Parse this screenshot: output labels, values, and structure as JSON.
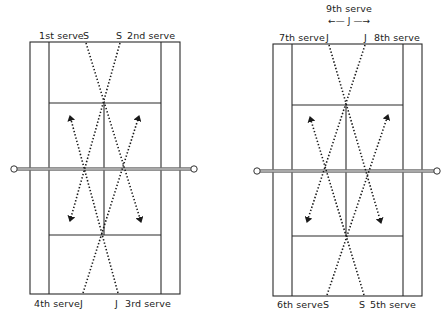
{
  "diagram": {
    "left_court": {
      "labels": {
        "top_left": "1st serve",
        "top_left_marker": "S",
        "top_right_marker": "S",
        "top_right": "2nd serve",
        "bottom_left": "4th serve",
        "bottom_left_marker": "J",
        "bottom_right_marker": "J",
        "bottom_right": "3rd serve"
      }
    },
    "right_court": {
      "labels": {
        "center_top": "9th serve",
        "center_arrow_marker": "←— J —→",
        "top_left": "7th serve",
        "top_left_marker": "J",
        "top_right_marker": "J",
        "top_right": "8th serve",
        "bottom_left": "6th serve",
        "bottom_left_marker": "S",
        "bottom_right_marker": "S",
        "bottom_right": "5th serve"
      }
    },
    "colors": {
      "line": "#2a2a2a",
      "net": "#a8a8a8",
      "background": "#ffffff"
    }
  }
}
